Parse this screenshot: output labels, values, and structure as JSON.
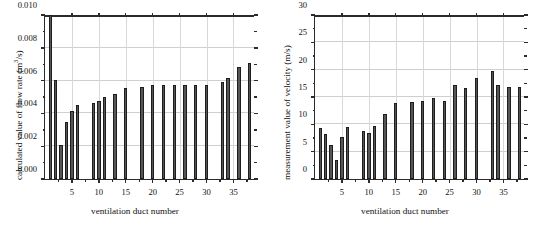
{
  "figure": {
    "background": "#ffffff",
    "bar_color": "#565656",
    "bar_edge_color": "#1d1d1d",
    "grid_color": "#cfcfcf",
    "axis_color": "#2b2b2b"
  },
  "chart_data": [
    {
      "type": "bar",
      "panel": "left",
      "title": "",
      "xlabel": "ventilation duct number",
      "ylabel_plain": "calculated value of flow rate (m3/s)",
      "ylabel_prefix": "calculated value of flow rate (m",
      "ylabel_sup": "3",
      "ylabel_suffix": "/s)",
      "xlim": [
        0,
        39
      ],
      "ylim": [
        0.0,
        0.01
      ],
      "ytick_labels": [
        "0.000",
        "0.002",
        "0.004",
        "0.006",
        "0.008",
        "0.010"
      ],
      "ytick_values": [
        0.0,
        0.002,
        0.004,
        0.006,
        0.008,
        0.01
      ],
      "xtick_labels": [
        "5",
        "10",
        "15",
        "20",
        "25",
        "30",
        "35"
      ],
      "xtick_values": [
        5,
        10,
        15,
        20,
        25,
        30,
        35
      ],
      "grid": "y-major and x-major",
      "legend": "none",
      "clipped_note": "bar at duct 1 exceeds the axis maximum and is clipped at 0.010",
      "x": [
        1,
        2,
        3,
        4,
        5,
        6,
        9,
        10,
        11,
        13,
        15,
        18,
        20,
        22,
        24,
        26,
        28,
        30,
        33,
        34,
        36,
        38
      ],
      "values": [
        0.0104,
        0.00605,
        0.00207,
        0.0035,
        0.00413,
        0.00452,
        0.00462,
        0.00478,
        0.00498,
        0.00521,
        0.00557,
        0.00563,
        0.00572,
        0.00574,
        0.00575,
        0.00576,
        0.00576,
        0.00576,
        0.00592,
        0.00613,
        0.00682,
        0.0071
      ]
    },
    {
      "type": "bar",
      "panel": "right",
      "title": "",
      "xlabel": "ventilation duct number",
      "ylabel_plain": "measurement value of velocity (m/s)",
      "ylabel_prefix": "measurement value of velocity (m/s)",
      "ylabel_sup": "",
      "ylabel_suffix": "",
      "xlim": [
        0,
        39
      ],
      "ylim": [
        0,
        30
      ],
      "ytick_labels": [
        "0",
        "5",
        "10",
        "15",
        "20",
        "25",
        "30"
      ],
      "ytick_values": [
        0,
        5,
        10,
        15,
        20,
        25,
        30
      ],
      "xtick_labels": [
        "5",
        "10",
        "15",
        "20",
        "25",
        "30",
        "35"
      ],
      "xtick_values": [
        5,
        10,
        15,
        20,
        25,
        30,
        35
      ],
      "grid": "y-major and x-major",
      "legend": "none",
      "clipped_note": "",
      "x": [
        1,
        2,
        3,
        4,
        5,
        6,
        9,
        10,
        11,
        13,
        15,
        18,
        20,
        22,
        24,
        26,
        28,
        30,
        33,
        34,
        36,
        38
      ],
      "values": [
        9.4,
        8.3,
        6.3,
        3.4,
        7.7,
        9.5,
        8.7,
        8.5,
        9.7,
        11.9,
        13.9,
        14.0,
        14.2,
        14.9,
        14.2,
        17.2,
        16.7,
        18.4,
        19.8,
        17.2,
        16.8,
        16.8
      ]
    }
  ]
}
